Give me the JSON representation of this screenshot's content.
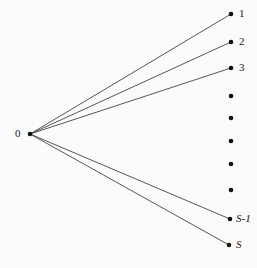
{
  "diagram": {
    "type": "star-graph",
    "root": {
      "label": "0",
      "x": 30,
      "y": 134
    },
    "leaves": [
      {
        "label": "1",
        "x": 231,
        "y": 14,
        "connected": true
      },
      {
        "label": "2",
        "x": 231,
        "y": 42,
        "connected": true
      },
      {
        "label": "3",
        "x": 231,
        "y": 68,
        "connected": true
      },
      {
        "label": "",
        "x": 231,
        "y": 96,
        "connected": false
      },
      {
        "label": "",
        "x": 231,
        "y": 118,
        "connected": false
      },
      {
        "label": "",
        "x": 231,
        "y": 141,
        "connected": false
      },
      {
        "label": "",
        "x": 231,
        "y": 164,
        "connected": false
      },
      {
        "label": "",
        "x": 231,
        "y": 190,
        "connected": false
      },
      {
        "label": "S-1",
        "x": 230,
        "y": 219,
        "connected": true
      },
      {
        "label": "S",
        "x": 229,
        "y": 245,
        "connected": true
      }
    ],
    "colors": {
      "edge": "#444444",
      "node": "#111111",
      "text": "#222222"
    }
  }
}
